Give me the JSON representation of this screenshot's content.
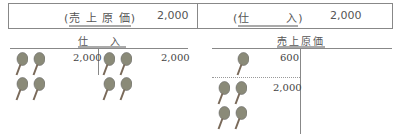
{
  "journal_entry": {
    "debit": {
      "account": "売 上 原 価",
      "amount": "2,000"
    },
    "credit": {
      "account": "仕　　　入",
      "amount": "2,000"
    }
  },
  "t_accounts": [
    {
      "title": "仕　入",
      "debit_entries": [
        {
          "amount": "2,000",
          "icon": "racket-icon",
          "count": 4
        }
      ],
      "credit_entries": [
        {
          "amount": "2,000",
          "icon": "racket-icon",
          "count": 4
        }
      ]
    },
    {
      "title": "売上原価",
      "debit_entries": [
        {
          "amount": "600",
          "icon": "racket-icon",
          "count": 1
        },
        {
          "amount": "2,000",
          "icon": "racket-icon",
          "count": 4
        }
      ],
      "credit_entries": []
    }
  ],
  "colors": {
    "racket": "#7a7a6a",
    "line": "#888888"
  }
}
